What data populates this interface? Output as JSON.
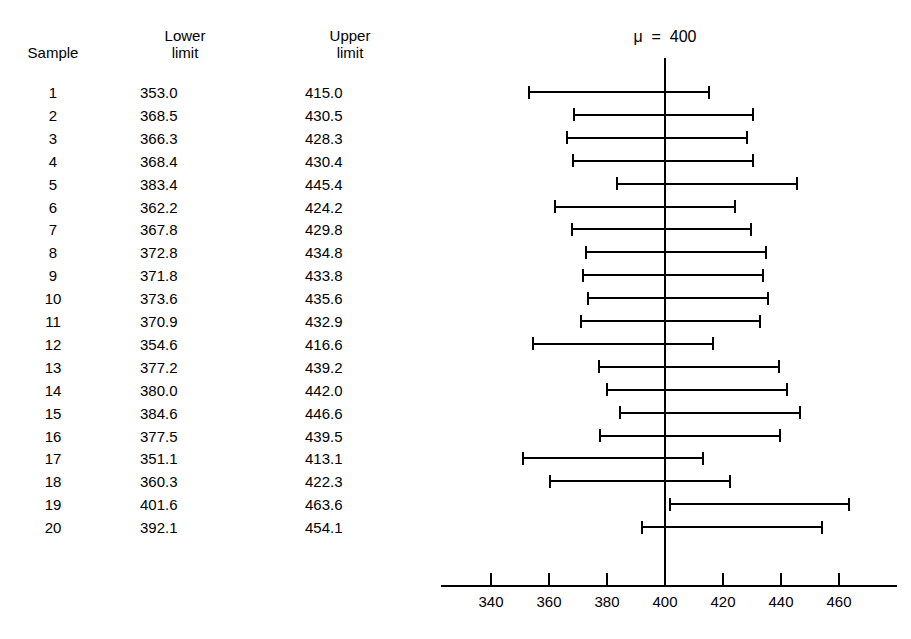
{
  "chart_data": {
    "type": "line",
    "annotation": "μ  =  400",
    "mu": 400,
    "xlabel": "",
    "ylabel": "Sample",
    "xlim": [
      330,
      475
    ],
    "xticks": [
      340,
      360,
      380,
      400,
      420,
      440,
      460
    ],
    "xticklabels": [
      "340",
      "360",
      "380",
      "400",
      "420",
      "440",
      "460"
    ],
    "grid": false,
    "legend": null,
    "columns": [
      "Sample",
      "Lower limit",
      "Upper limit"
    ],
    "categories": [
      "1",
      "2",
      "3",
      "4",
      "5",
      "6",
      "7",
      "8",
      "9",
      "10",
      "11",
      "12",
      "13",
      "14",
      "15",
      "16",
      "17",
      "18",
      "19",
      "20"
    ],
    "series": [
      {
        "name": "Lower limit",
        "values": [
          353.0,
          368.5,
          366.3,
          368.4,
          383.4,
          362.2,
          367.8,
          372.8,
          371.8,
          373.6,
          370.9,
          354.6,
          377.2,
          380.0,
          384.6,
          377.5,
          351.1,
          360.3,
          401.6,
          392.1
        ]
      },
      {
        "name": "Upper limit",
        "values": [
          415.0,
          430.5,
          428.3,
          430.4,
          445.4,
          424.2,
          429.8,
          434.8,
          433.8,
          435.6,
          432.9,
          416.6,
          439.2,
          442.0,
          446.6,
          439.5,
          413.1,
          422.3,
          463.6,
          454.1
        ]
      }
    ]
  },
  "table": {
    "headers": {
      "sample": "Sample",
      "lower_line1": "Lower",
      "lower_line2": "limit",
      "upper_line1": "Upper",
      "upper_line2": "limit"
    },
    "rows": [
      {
        "sample": "1",
        "lower": "353.0",
        "upper": "415.0"
      },
      {
        "sample": "2",
        "lower": "368.5",
        "upper": "430.5"
      },
      {
        "sample": "3",
        "lower": "366.3",
        "upper": "428.3"
      },
      {
        "sample": "4",
        "lower": "368.4",
        "upper": "430.4"
      },
      {
        "sample": "5",
        "lower": "383.4",
        "upper": "445.4"
      },
      {
        "sample": "6",
        "lower": "362.2",
        "upper": "424.2"
      },
      {
        "sample": "7",
        "lower": "367.8",
        "upper": "429.8"
      },
      {
        "sample": "8",
        "lower": "372.8",
        "upper": "434.8"
      },
      {
        "sample": "9",
        "lower": "371.8",
        "upper": "433.8"
      },
      {
        "sample": "10",
        "lower": "373.6",
        "upper": "435.6"
      },
      {
        "sample": "11",
        "lower": "370.9",
        "upper": "432.9"
      },
      {
        "sample": "12",
        "lower": "354.6",
        "upper": "416.6"
      },
      {
        "sample": "13",
        "lower": "377.2",
        "upper": "439.2"
      },
      {
        "sample": "14",
        "lower": "380.0",
        "upper": "442.0"
      },
      {
        "sample": "15",
        "lower": "384.6",
        "upper": "446.6"
      },
      {
        "sample": "16",
        "lower": "377.5",
        "upper": "439.5"
      },
      {
        "sample": "17",
        "lower": "351.1",
        "upper": "413.1"
      },
      {
        "sample": "18",
        "lower": "360.3",
        "upper": "422.3"
      },
      {
        "sample": "19",
        "lower": "401.6",
        "upper": "463.6"
      },
      {
        "sample": "20",
        "lower": "392.1",
        "upper": "454.1"
      }
    ]
  },
  "plot": {
    "mu_label": "μ  =  400",
    "tick_labels": [
      "340",
      "360",
      "380",
      "400",
      "420",
      "440",
      "460"
    ]
  },
  "colors": {
    "ink": "#000000",
    "background": "#ffffff"
  }
}
